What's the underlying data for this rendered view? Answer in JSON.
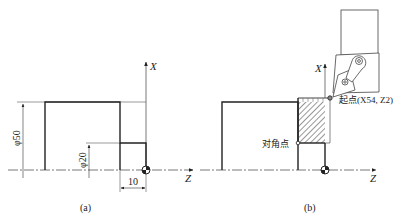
{
  "figure_a": {
    "caption": "(a)",
    "axis_x_label": "X",
    "axis_z_label": "Z",
    "dim_d50": "φ50",
    "dim_d20": "φ20",
    "dim_length": "10"
  },
  "figure_b": {
    "caption": "(b)",
    "axis_x_label": "X",
    "axis_z_label": "Z",
    "start_point_label": "起点(X54, Z2)",
    "corner_point_label": "对角点"
  },
  "colors": {
    "line": "#222222",
    "thin_line": "#555555",
    "hatch": "#333333"
  }
}
